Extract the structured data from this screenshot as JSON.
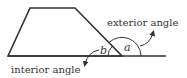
{
  "diagram": {
    "title": "",
    "labels": {
      "exterior": "exterior angle",
      "interior": "interior angle",
      "angle_a": "a",
      "angle_b": "b"
    },
    "colors": {
      "stroke": "#333333",
      "background": "#ffffff"
    },
    "shape": {
      "type": "trapezoid",
      "vertices": [
        [
          30,
          8
        ],
        [
          75,
          8
        ],
        [
          122,
          56
        ],
        [
          8,
          56
        ]
      ],
      "extended_base_end": [
        166,
        56
      ]
    }
  }
}
